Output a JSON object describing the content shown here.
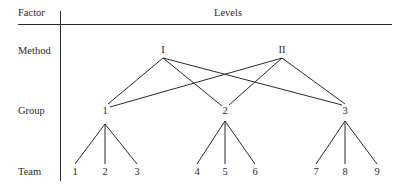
{
  "header": {
    "factor_label": "Factor",
    "levels_label": "Levels"
  },
  "rows": [
    {
      "factor": "Method"
    },
    {
      "factor": "Group"
    },
    {
      "factor": "Team"
    }
  ],
  "method_levels": [
    "I",
    "II"
  ],
  "group_levels": [
    "1",
    "2",
    "3"
  ],
  "team_levels": [
    "1",
    "2",
    "3",
    "4",
    "5",
    "6",
    "7",
    "8",
    "9"
  ],
  "edges": {
    "method_to_group": [
      [
        "I",
        "1"
      ],
      [
        "I",
        "2"
      ],
      [
        "I",
        "3"
      ],
      [
        "II",
        "1"
      ],
      [
        "II",
        "2"
      ],
      [
        "II",
        "3"
      ]
    ],
    "group_to_team": [
      [
        "1",
        "1"
      ],
      [
        "1",
        "2"
      ],
      [
        "1",
        "3"
      ],
      [
        "2",
        "4"
      ],
      [
        "2",
        "5"
      ],
      [
        "2",
        "6"
      ],
      [
        "3",
        "7"
      ],
      [
        "3",
        "8"
      ],
      [
        "3",
        "9"
      ]
    ]
  }
}
